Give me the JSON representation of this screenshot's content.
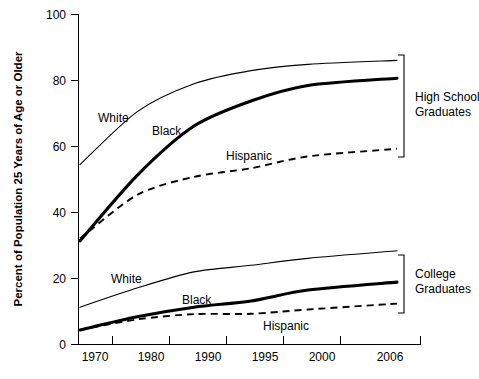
{
  "chart_data": {
    "type": "line",
    "title": "",
    "subtitle": "",
    "xlabel": "",
    "ylabel": "Percent of Population 25 Years of Age or Older",
    "categories": [
      "1970",
      "1980",
      "1990",
      "1995",
      "2000",
      "2006"
    ],
    "x_tick_labels": [
      "1970",
      "1980",
      "1990",
      "1995",
      "2000",
      "2006"
    ],
    "y_tick_labels": [
      "0",
      "20",
      "40",
      "60",
      "80",
      "100"
    ],
    "y_ticks": [
      0,
      20,
      40,
      60,
      80,
      100
    ],
    "ylim": [
      0,
      100
    ],
    "grid": false,
    "legend_position": "inline-annotations",
    "groups": [
      {
        "name": "High School Graduates",
        "label": "High School\nGraduates",
        "label_line1": "High School",
        "label_line2": "Graduates",
        "series": [
          {
            "name": "White",
            "style": "thin-solid",
            "values": [
              54.5,
              70.5,
              79.0,
              83.0,
              84.9,
              86.1
            ]
          },
          {
            "name": "Black",
            "style": "thick-solid",
            "values": [
              31.4,
              51.2,
              66.2,
              73.8,
              78.5,
              80.7
            ]
          },
          {
            "name": "Hispanic",
            "style": "dashed",
            "values": [
              32.1,
              45.3,
              50.8,
              53.4,
              57.0,
              59.3
            ]
          }
        ]
      },
      {
        "name": "College Graduates",
        "label": "College\nGraduates",
        "label_line1": "College",
        "label_line2": "Graduates",
        "series": [
          {
            "name": "White",
            "style": "thin-solid",
            "values": [
              11.3,
              17.1,
              22.0,
              24.0,
              26.1,
              28.4
            ]
          },
          {
            "name": "Black",
            "style": "thick-solid",
            "values": [
              4.4,
              8.4,
              11.3,
              13.2,
              16.5,
              18.9
            ]
          },
          {
            "name": "Hispanic",
            "style": "dashed",
            "values": [
              4.4,
              7.6,
              9.2,
              9.3,
              10.6,
              12.4
            ]
          }
        ]
      }
    ],
    "annotations": [
      {
        "text": "White",
        "group": "High School Graduates",
        "x_px": 98,
        "y_px": 122
      },
      {
        "text": "Black",
        "group": "High School Graduates",
        "x_px": 152,
        "y_px": 135
      },
      {
        "text": "Hispanic",
        "group": "High School Graduates",
        "x_px": 226,
        "y_px": 160
      },
      {
        "text": "White",
        "group": "College Graduates",
        "x_px": 111,
        "y_px": 283
      },
      {
        "text": "Black",
        "group": "College Graduates",
        "x_px": 182,
        "y_px": 304
      },
      {
        "text": "Hispanic",
        "group": "College Graduates",
        "x_px": 263,
        "y_px": 330
      }
    ]
  }
}
